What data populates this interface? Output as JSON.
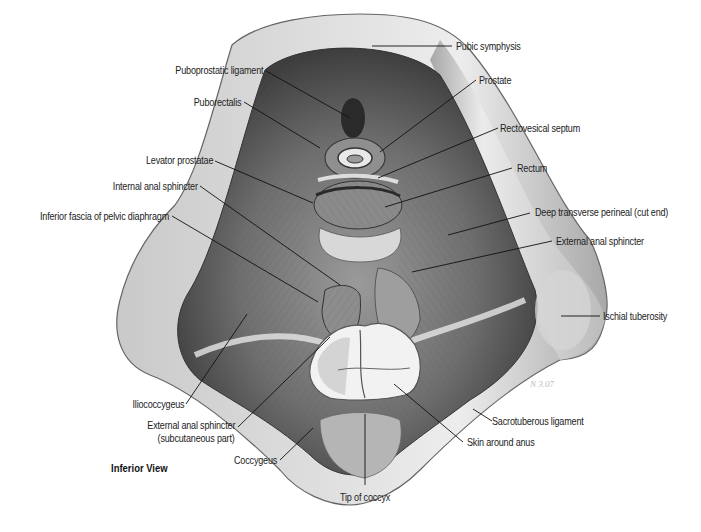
{
  "figure": {
    "view_caption": "Inferior View",
    "signature": "N 3.07",
    "labels": {
      "pubic_symphysis": "Pubic symphysis",
      "puboprostatic_ligament": "Puboprostatic ligament",
      "prostate": "Prostate",
      "puborectalis": "Puborectalis",
      "rectovesical_septum": "Rectovesical septum",
      "rectum": "Rectum",
      "levator_prostatae": "Levator prostatae",
      "internal_anal_sphincter": "Internal anal sphincter",
      "deep_transverse_perineal": "Deep transverse perineal (cut end)",
      "inferior_fascia": "Inferior fascia of pelvic diaphragm",
      "external_anal_sphincter": "External anal sphincter",
      "ischial_tuberosity": "Ischial tuberosity",
      "iliococcygeus": "Iliococcygeus",
      "external_anal_sphincter_sub_line1": "External anal sphincter",
      "external_anal_sphincter_sub_line2": "(subcutaneous part)",
      "sacrotuberous_ligament": "Sacrotuberous ligament",
      "skin_around_anus": "Skin around anus",
      "coccygeus": "Coccygeus",
      "tip_of_coccyx": "Tip of coccyx"
    }
  }
}
